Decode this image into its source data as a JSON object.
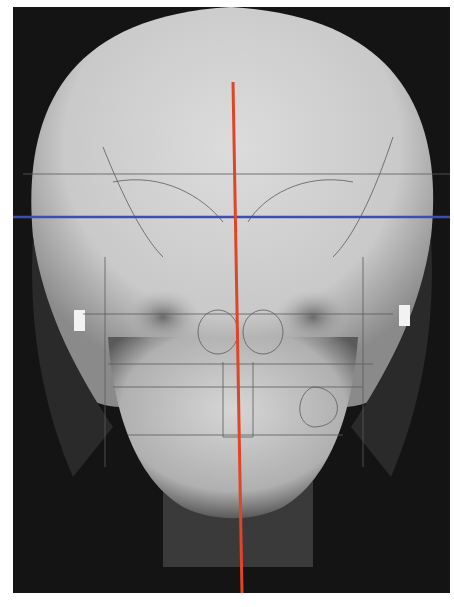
{
  "image": {
    "subject": "Frontal (PA) cephalometric skull radiograph with tracing overlay",
    "background_color": "#ffffff",
    "film_color": "#141414"
  },
  "overlay": {
    "midline": {
      "label": "facial midline",
      "color": "#e0452a",
      "x1": 220,
      "y1": 75,
      "x2": 229,
      "y2": 586
    },
    "horizontal_reference": {
      "label": "horizontal reference line",
      "color": "#3b4fb0",
      "y": 210
    }
  },
  "colors": {
    "skull_light": "#d9d9d9",
    "skull_mid": "#a9a9a9",
    "tracing": "#5a5a5a"
  }
}
